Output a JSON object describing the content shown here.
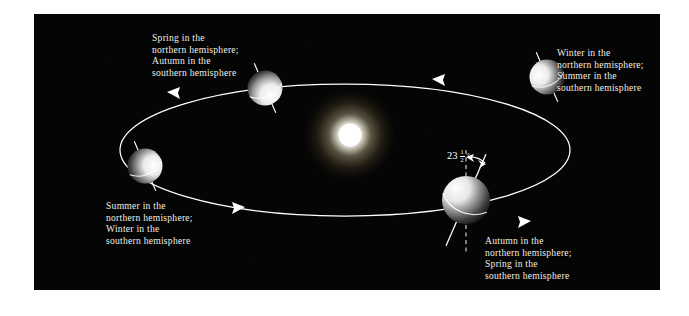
{
  "figure": {
    "type": "astronomy-diagram",
    "background_color": "#050505",
    "page_color": "#ffffff",
    "orbit_color": "#ffffff",
    "text_color": "#f2efe6"
  },
  "sun": {
    "label": "Sun",
    "color": "#ffffff",
    "glow_color": "#fff6d8"
  },
  "tilt": {
    "whole": "23",
    "numerator": "1",
    "denominator": "2",
    "degree_symbol": "°",
    "full_text": "23 1/2 °"
  },
  "orbit": {
    "direction": "counterclockwise",
    "arrow_count": 4
  },
  "positions": [
    {
      "id": "spring",
      "name": "spring-equinox-position",
      "lines": [
        "Spring in the",
        "northern hemisphere;",
        "Autumn in the",
        "southern hemisphere"
      ]
    },
    {
      "id": "winter",
      "name": "winter-solstice-position",
      "lines": [
        "Winter in the",
        "northern hemisphere;",
        "Summer in the",
        "southern hemisphere"
      ]
    },
    {
      "id": "summer",
      "name": "summer-solstice-position",
      "lines": [
        "Summer in the",
        "northern hemisphere;",
        "Winter in the",
        "southern hemisphere"
      ]
    },
    {
      "id": "autumn",
      "name": "autumn-equinox-position",
      "lines": [
        "Autumn in the",
        "northern hemisphere;",
        "Spring in the",
        "southern hemisphere"
      ]
    }
  ]
}
